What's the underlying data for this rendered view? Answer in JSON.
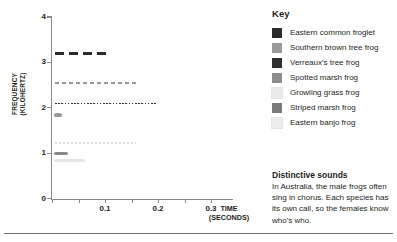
{
  "chart_data": {
    "type": "line",
    "title": "",
    "xlabel": "TIME (SECONDS)",
    "ylabel": "FREQUENCY (KILOHERTZ)",
    "xlim": [
      0,
      0.34
    ],
    "ylim": [
      0,
      4
    ],
    "x_ticks": [
      0,
      0.05,
      0.1,
      0.15,
      0.2,
      0.25,
      0.3
    ],
    "x_tick_labels": [
      "",
      "",
      "0.1",
      "",
      "0.2",
      "",
      "0.3"
    ],
    "y_ticks": [
      0,
      1,
      2,
      3,
      4
    ],
    "y_tick_labels": [
      "0",
      "1",
      "2",
      "3",
      "4"
    ],
    "grid": false,
    "legend_position": "right",
    "series": [
      {
        "name": "Eastern common froglet",
        "color": "#2b2b2b",
        "frequency_khz": 3.19,
        "t_start": 0.006,
        "t_end": 0.107,
        "style": "dashed",
        "dash": "9 5",
        "thickness": 2.6
      },
      {
        "name": "Southern brown tree frog",
        "color": "#9a9a9a",
        "frequency_khz": 2.55,
        "t_start": 0.006,
        "t_end": 0.162,
        "style": "dashed",
        "dash": "4 3",
        "thickness": 1.6
      },
      {
        "name": "Verreaux's tree frog",
        "color": "#2f2f2f",
        "frequency_khz": 2.09,
        "t_start": 0.006,
        "t_end": 0.197,
        "style": "dotted",
        "dash": "1.6 1.6",
        "thickness": 1.4
      },
      {
        "name": "Spotted marsh frog",
        "color": "#8d8d8d",
        "frequency_khz": 1.84,
        "t_start": 0.004,
        "t_end": 0.018,
        "style": "solid-blob",
        "dash": "",
        "thickness": 3.2
      },
      {
        "name": "Growling grass frog",
        "color": "#dcdcdc",
        "frequency_khz": 1.22,
        "t_start": 0.006,
        "t_end": 0.158,
        "style": "dotted",
        "dash": "2 2",
        "thickness": 2.0
      },
      {
        "name": "Striped marsh frog",
        "color": "#7a7a7a",
        "frequency_khz": 0.99,
        "t_start": 0.004,
        "t_end": 0.03,
        "style": "solid-blob",
        "dash": "",
        "thickness": 2.6
      },
      {
        "name": "Eastern banjo frog",
        "color": "#e2e2e2",
        "frequency_khz": 0.84,
        "t_start": 0.004,
        "t_end": 0.062,
        "style": "solid-blob",
        "dash": "",
        "thickness": 3.4
      }
    ]
  },
  "key": {
    "title": "Key",
    "items": [
      {
        "label": "Eastern common froglet",
        "color": "#2b2b2b"
      },
      {
        "label": "Southern brown tree frog",
        "color": "#9a9a9a"
      },
      {
        "label": "Verreaux's tree frog",
        "color": "#2f2f2f"
      },
      {
        "label": "Spotted marsh frog",
        "color": "#8d8d8d"
      },
      {
        "label": "Growling grass frog",
        "color": "#e9e9e9"
      },
      {
        "label": "Striped marsh frog",
        "color": "#7a7a7a"
      },
      {
        "label": "Eastern banjo frog",
        "color": "#ededed"
      }
    ]
  },
  "note": {
    "title": "Distinctive sounds",
    "body": "In Australia, the male frogs often sing in chorus. Each species has its own call, so the females know who's who."
  },
  "axis_titles": {
    "y_line1": "FREQUENCY",
    "y_line2": "(KILOHERTZ)",
    "x_line1": "TIME",
    "x_line2": "(SECONDS)"
  }
}
